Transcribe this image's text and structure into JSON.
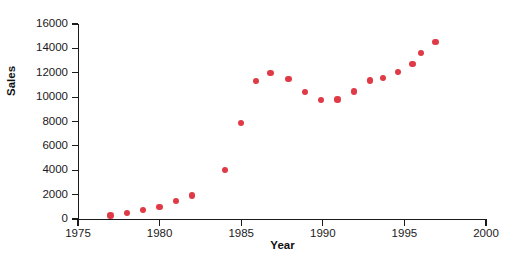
{
  "chart_data": {
    "type": "scatter",
    "title": "",
    "xlabel": "Year",
    "ylabel": "Sales",
    "xlim": [
      1975,
      2000
    ],
    "ylim": [
      0,
      16000
    ],
    "xticks": [
      1975,
      1980,
      1985,
      1990,
      1995,
      2000
    ],
    "xtick_labels": [
      "1975",
      "1980",
      "1985",
      "1990",
      "1995",
      "2000"
    ],
    "yticks": [
      0,
      2000,
      4000,
      6000,
      8000,
      10000,
      12000,
      14000,
      16000
    ],
    "ytick_labels": [
      "0",
      "2000",
      "4000",
      "6000",
      "8000",
      "10000",
      "12000",
      "14000",
      "16000"
    ],
    "grid": false,
    "legend": false,
    "marker_color": "#e03a46",
    "axis_color": "#1a1a1a",
    "background_color": "#ffffff",
    "series": [
      {
        "name": "Sales",
        "x": [
          1977,
          1978,
          1979,
          1980,
          1981,
          1982,
          1984,
          1985,
          1985.9,
          1986.9,
          1987.9,
          1988.9,
          1989.9,
          1990.9,
          1991.9,
          1992.9,
          1993.9,
          1994.9,
          1996.1
        ],
        "y": [
          300,
          500,
          750,
          980,
          1480,
          1920,
          4000,
          7900,
          11300,
          12000,
          11500,
          10400,
          9750,
          9800,
          10550,
          11100,
          11700,
          12300,
          12200
        ],
        "points": [
          {
            "x": 1977,
            "y": 300
          },
          {
            "x": 1978,
            "y": 500
          },
          {
            "x": 1979,
            "y": 750
          },
          {
            "x": 1980,
            "y": 980
          },
          {
            "x": 1981,
            "y": 1480
          },
          {
            "x": 1982,
            "y": 1920
          },
          {
            "x": 1984,
            "y": 4000
          },
          {
            "x": 1985,
            "y": 7900
          },
          {
            "x": 1985.9,
            "y": 11300
          },
          {
            "x": 1986.8,
            "y": 12000
          },
          {
            "x": 1987.9,
            "y": 11500
          },
          {
            "x": 1988.9,
            "y": 10400
          },
          {
            "x": 1989.9,
            "y": 9750
          },
          {
            "x": 1990.9,
            "y": 9800
          },
          {
            "x": 1991.9,
            "y": 10450
          },
          {
            "x": 1992.9,
            "y": 11350
          },
          {
            "x": 1993.7,
            "y": 11550
          },
          {
            "x": 1994.6,
            "y": 12050
          },
          {
            "x": 1995.5,
            "y": 12700
          },
          {
            "x": 1996.0,
            "y": 13600
          },
          {
            "x": 1996.9,
            "y": 14500
          }
        ]
      }
    ]
  }
}
